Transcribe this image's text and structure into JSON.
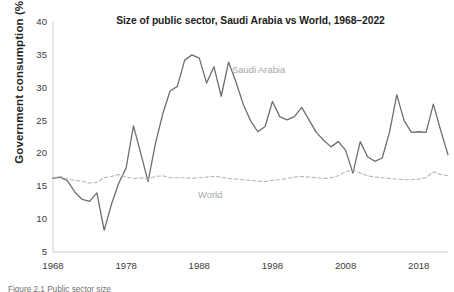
{
  "figure": {
    "title": "Size of public sector, Saudi Arabia vs World, 1968–2022",
    "y_axis_title": "Government consumption (% GDP)",
    "caption": "Figure 2.1  Public sector size",
    "series_label_saudi": "Saudi Arabia",
    "series_label_world": "World"
  },
  "colors": {
    "saudi_line": "#6b6f72",
    "world_line": "#b9b9b9",
    "axis": "#cfcfcf",
    "text": "#2b2b2b",
    "label_text": "#a6a6a6",
    "background": "#ffffff"
  },
  "chart_data": {
    "type": "line",
    "title": "Size of public sector, Saudi Arabia vs World, 1968–2022",
    "xlabel": "",
    "ylabel": "Government consumption (% GDP)",
    "xlim": [
      1968,
      2022
    ],
    "ylim": [
      5,
      40
    ],
    "yticks": [
      5,
      10,
      15,
      20,
      25,
      30,
      35,
      40
    ],
    "xticks": [
      1968,
      1978,
      1988,
      1998,
      2008,
      2018
    ],
    "grid": false,
    "legend": "inline-annotation",
    "x": [
      1968,
      1969,
      1970,
      1971,
      1972,
      1973,
      1974,
      1975,
      1976,
      1977,
      1978,
      1979,
      1980,
      1981,
      1982,
      1983,
      1984,
      1985,
      1986,
      1987,
      1988,
      1989,
      1990,
      1991,
      1992,
      1993,
      1994,
      1995,
      1996,
      1997,
      1998,
      1999,
      2000,
      2001,
      2002,
      2003,
      2004,
      2005,
      2006,
      2007,
      2008,
      2009,
      2010,
      2011,
      2012,
      2013,
      2014,
      2015,
      2016,
      2017,
      2018,
      2019,
      2020,
      2021,
      2022
    ],
    "series": [
      {
        "name": "Saudi Arabia",
        "style": "solid",
        "color": "#6b6f72",
        "values": [
          16.2,
          16.4,
          15.8,
          14.1,
          13.0,
          12.7,
          14.0,
          8.3,
          12.3,
          15.5,
          17.8,
          24.2,
          20.0,
          15.7,
          21.5,
          26.0,
          29.5,
          30.2,
          34.2,
          35.0,
          34.5,
          30.7,
          33.2,
          28.7,
          33.9,
          30.9,
          27.5,
          25.0,
          23.3,
          24.1,
          27.9,
          25.6,
          25.1,
          25.6,
          27.0,
          25.1,
          23.2,
          22.0,
          21.0,
          21.8,
          20.5,
          17.0,
          21.8,
          19.5,
          18.8,
          19.3,
          23.2,
          28.9,
          25.0,
          23.2,
          23.3,
          23.2,
          27.5,
          23.5,
          19.8
        ]
      },
      {
        "name": "World",
        "style": "dashed",
        "color": "#b9b9b9",
        "values": [
          16.3,
          16.5,
          16.1,
          15.9,
          15.8,
          15.5,
          15.6,
          16.3,
          16.5,
          16.8,
          16.4,
          16.2,
          16.3,
          16.1,
          16.5,
          16.6,
          16.3,
          16.3,
          16.3,
          16.2,
          16.3,
          16.4,
          16.5,
          16.4,
          16.2,
          16.1,
          16.0,
          15.9,
          15.8,
          15.7,
          15.9,
          16.0,
          16.2,
          16.4,
          16.5,
          16.4,
          16.3,
          16.2,
          16.3,
          16.6,
          17.2,
          17.5,
          17.0,
          16.6,
          16.4,
          16.3,
          16.2,
          16.1,
          16.0,
          16.0,
          16.1,
          16.3,
          17.2,
          16.8,
          16.6
        ]
      }
    ],
    "annotations": [
      {
        "text": "Saudi Arabia",
        "x": 1995,
        "y": 32.5
      },
      {
        "text": "World",
        "x": 1990,
        "y": 14.2
      }
    ]
  }
}
